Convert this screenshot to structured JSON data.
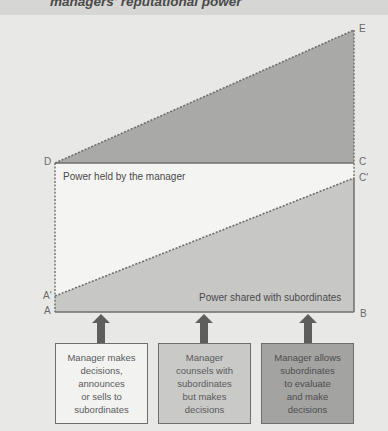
{
  "title": "managers' reputational power",
  "colors": {
    "background": "#e8e8e6",
    "manager_region": "#f4f4f3",
    "upper_triangle": "#a9a9a8",
    "shared_region": "#c7c7c6",
    "box_light": "#f2f2f1",
    "box_mid": "#c9c9c8",
    "box_dark": "#a3a3a2",
    "arrow": "#5e5e5e"
  },
  "points": {
    "A": "A",
    "A_prime": "A'",
    "B": "B",
    "C": "C",
    "C_prime": "C'",
    "D": "D",
    "E": "E"
  },
  "regions": {
    "manager": "Power held by the manager",
    "shared": "Power shared with subordinates"
  },
  "boxes": [
    {
      "lines": [
        "Manager makes",
        "decisions,",
        "announces",
        "or sells to",
        "subordinates"
      ]
    },
    {
      "lines": [
        "Manager",
        "counsels with",
        "subordinates",
        "but makes",
        "decisions"
      ]
    },
    {
      "lines": [
        "Manager allows",
        "subordinates",
        "to evaluate",
        "and make",
        "decisions"
      ]
    }
  ]
}
